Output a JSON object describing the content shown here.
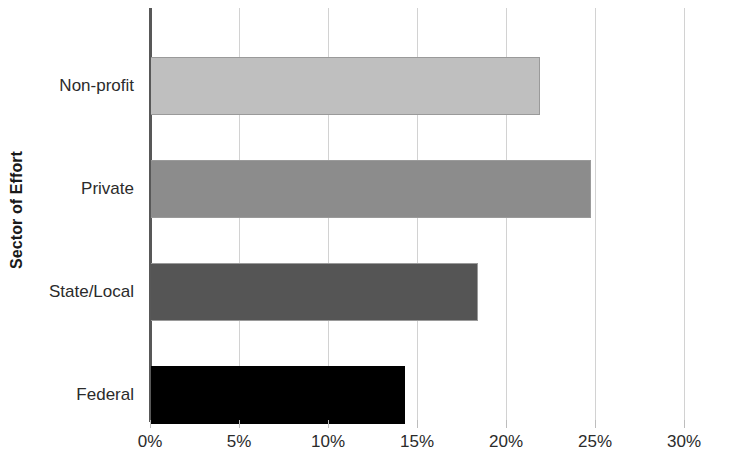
{
  "chart_data": {
    "type": "bar",
    "orientation": "horizontal",
    "title": "",
    "xlabel": "",
    "ylabel": "Sector of Effort",
    "categories": [
      "Non-profit",
      "Private",
      "State/Local",
      "Federal"
    ],
    "values": [
      21.9,
      24.8,
      18.4,
      14.3
    ],
    "value_labels": [
      "21.9%",
      "24.8%",
      "18.4%",
      "14.3%"
    ],
    "series": [
      {
        "name": "Percent of Effort",
        "values": [
          21.9,
          24.8,
          18.4,
          14.3
        ]
      }
    ],
    "xlim": [
      0,
      30
    ],
    "ylim": null,
    "xticks": [
      0,
      5,
      10,
      15,
      20,
      25,
      30
    ],
    "xticklabels": [
      "0%",
      "5%",
      "10%",
      "15%",
      "20%",
      "25%",
      "30%"
    ],
    "grid": "vertical",
    "legend": "none",
    "bar_colors": [
      "#bfbfbf",
      "#8c8c8c",
      "#555555",
      "#000000"
    ],
    "bar_border_color": "#9a9a9a",
    "gridline_color": "#d2d2d2",
    "axis_color": "#585858",
    "background_color": "#ffffff"
  },
  "axes": {
    "y_title": "Sector of Effort",
    "x_tick_labels": [
      "0%",
      "5%",
      "10%",
      "15%",
      "20%",
      "25%",
      "30%"
    ],
    "category_labels": [
      "Non-profit",
      "Private",
      "State/Local",
      "Federal"
    ]
  }
}
